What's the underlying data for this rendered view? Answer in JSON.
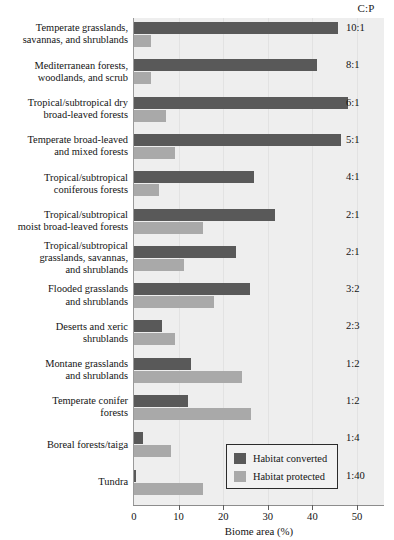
{
  "header": {
    "cp_column_title": "C:P"
  },
  "legend": {
    "items": [
      {
        "label": "Habitat converted",
        "color": "#595959",
        "key": "converted"
      },
      {
        "label": "Habitat protected",
        "color": "#a9a9a9",
        "key": "protected"
      }
    ]
  },
  "axis": {
    "xlabel": "Biome area (%)",
    "ticks": [
      0,
      10,
      20,
      30,
      40,
      50
    ],
    "tick_labels": [
      "0",
      "10",
      "20",
      "30",
      "40",
      "50"
    ],
    "xlim": [
      0,
      56.3
    ]
  },
  "chart_data": {
    "type": "bar",
    "orientation": "horizontal",
    "title": "",
    "xlabel": "Biome area (%)",
    "ylabel": "",
    "xlim": [
      0,
      56.3
    ],
    "grid": false,
    "legend_position": "bottom-right-inside",
    "categories": [
      "Temperate grasslands, savannas, and shrublands",
      "Mediterranean forests, woodlands, and scrub",
      "Tropical/subtropical dry broad-leaved forests",
      "Temperate broad-leaved and mixed forests",
      "Tropical/subtropical coniferous forests",
      "Tropical/subtropical moist broad-leaved forests",
      "Tropical/subtropical grasslands, savannas, and shrublands",
      "Flooded grasslands and shrublands",
      "Deserts and xeric shrublands",
      "Montane grasslands and shrublands",
      "Temperate conifer forests",
      "Boreal forests/taiga",
      "Tundra"
    ],
    "series": [
      {
        "name": "Habitat converted",
        "color": "#595959",
        "values": [
          45.7,
          41.0,
          48.0,
          46.4,
          26.9,
          31.6,
          22.8,
          26.0,
          6.2,
          12.7,
          12.2,
          2.1,
          0.5
        ]
      },
      {
        "name": "Habitat protected",
        "color": "#a9a9a9",
        "values": [
          3.9,
          3.9,
          7.1,
          9.1,
          5.7,
          15.4,
          11.3,
          17.9,
          9.1,
          24.2,
          26.2,
          8.2,
          15.4
        ]
      }
    ],
    "annotation_column": {
      "header": "C:P",
      "values": [
        "10:1",
        "8:1",
        "6:1",
        "5:1",
        "4:1",
        "2:1",
        "2:1",
        "3:2",
        "2:3",
        "1:2",
        "1:2",
        "1:4",
        "1:40"
      ]
    }
  },
  "rows": [
    {
      "label_lines": [
        "Temperate grasslands,",
        "savannas, and shrublands"
      ],
      "cp": "10:1"
    },
    {
      "label_lines": [
        "Mediterranean forests,",
        "woodlands, and scrub"
      ],
      "cp": "8:1"
    },
    {
      "label_lines": [
        "Tropical/subtropical dry",
        "broad-leaved forests"
      ],
      "cp": "6:1"
    },
    {
      "label_lines": [
        "Temperate broad-leaved",
        "and mixed forests"
      ],
      "cp": "5:1"
    },
    {
      "label_lines": [
        "Tropical/subtropical",
        "coniferous forests"
      ],
      "cp": "4:1"
    },
    {
      "label_lines": [
        "Tropical/subtropical",
        "moist broad-leaved forests"
      ],
      "cp": "2:1"
    },
    {
      "label_lines": [
        "Tropical/subtropical",
        "grasslands, savannas,",
        "and shrublands"
      ],
      "cp": "2:1"
    },
    {
      "label_lines": [
        "Flooded grasslands",
        "and shrublands"
      ],
      "cp": "3:2"
    },
    {
      "label_lines": [
        "Deserts and xeric",
        "shrublands"
      ],
      "cp": "2:3"
    },
    {
      "label_lines": [
        "Montane grasslands",
        "and shrublands"
      ],
      "cp": "1:2"
    },
    {
      "label_lines": [
        "Temperate conifer",
        "forests"
      ],
      "cp": "1:2"
    },
    {
      "label_lines": [
        "Boreal forests/taiga"
      ],
      "cp": "1:4"
    },
    {
      "label_lines": [
        "Tundra"
      ],
      "cp": "1:40"
    }
  ]
}
